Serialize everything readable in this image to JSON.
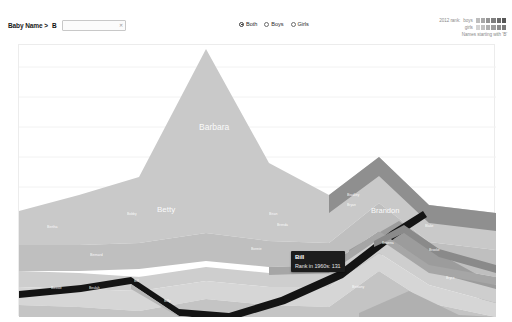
{
  "toolbar": {
    "filter_label": "Baby Name >",
    "filter_value": "B",
    "input_placeholder": "",
    "clear_icon": "clear-icon",
    "gender_options": [
      {
        "label": "Both",
        "selected": true
      },
      {
        "label": "Boys",
        "selected": false
      },
      {
        "label": "Girls",
        "selected": false
      }
    ]
  },
  "legend": {
    "rank_label": "2012 rank:",
    "boys_label": "boys",
    "girls_label": "girls",
    "note": "Names starting with 'B'",
    "boys_scale": [
      "#bdbdbd",
      "#a8a8a8",
      "#949494",
      "#7f7f7f",
      "#6b6b6b",
      "#565656"
    ],
    "girls_scale": [
      "#d4d4d4",
      "#c2c2c2",
      "#b0b0b0",
      "#9e9e9e",
      "#8c8c8c",
      "#7a7a7a"
    ]
  },
  "tooltip": {
    "name": "Bill",
    "detail": "Rank in 1960s: 131"
  },
  "chart_data": {
    "type": "area",
    "xlabel": "",
    "ylabel": "",
    "grid": true,
    "legend_position": "top-right",
    "x": [
      "1880s",
      "1890s",
      "1900s",
      "1910s",
      "1920s",
      "1930s",
      "1940s",
      "1950s",
      "1960s",
      "1970s",
      "1980s",
      "1990s",
      "2000s",
      "2010s"
    ],
    "highlighted_series": "Bill",
    "highlight_value": 131,
    "highlight_decade": "1960s",
    "series": [
      {
        "name": "Barbara",
        "values": [
          6,
          10,
          18,
          60,
          210,
          395,
          300,
          205,
          120,
          52,
          22,
          10,
          6,
          4
        ]
      },
      {
        "name": "Betty",
        "values": [
          30,
          48,
          72,
          150,
          320,
          300,
          170,
          96,
          44,
          18,
          9,
          5,
          3,
          2
        ]
      },
      {
        "name": "Bertha",
        "values": [
          70,
          66,
          54,
          40,
          24,
          13,
          7,
          4,
          2,
          1,
          1,
          1,
          1,
          1
        ]
      },
      {
        "name": "Bessie",
        "values": [
          62,
          58,
          46,
          32,
          18,
          10,
          5,
          3,
          2,
          1,
          1,
          1,
          1,
          1
        ]
      },
      {
        "name": "Beulah",
        "values": [
          22,
          24,
          21,
          17,
          11,
          6,
          3,
          2,
          1,
          1,
          1,
          1,
          1,
          1
        ]
      },
      {
        "name": "Bill",
        "values": [
          4,
          7,
          12,
          22,
          40,
          58,
          66,
          60,
          48,
          30,
          16,
          8,
          5,
          3
        ]
      },
      {
        "name": "Billy",
        "values": [
          3,
          6,
          14,
          34,
          74,
          110,
          120,
          102,
          70,
          40,
          20,
          10,
          6,
          4
        ]
      },
      {
        "name": "Bobby",
        "values": [
          2,
          3,
          6,
          18,
          52,
          96,
          112,
          94,
          62,
          34,
          17,
          9,
          5,
          3
        ]
      },
      {
        "name": "Benjamin",
        "values": [
          26,
          24,
          22,
          22,
          24,
          26,
          34,
          44,
          58,
          92,
          140,
          168,
          190,
          205
        ]
      },
      {
        "name": "Brandon",
        "values": [
          1,
          1,
          1,
          1,
          2,
          3,
          5,
          10,
          26,
          86,
          190,
          235,
          150,
          70
        ]
      },
      {
        "name": "Bradley",
        "values": [
          1,
          1,
          1,
          2,
          4,
          7,
          12,
          22,
          36,
          52,
          60,
          52,
          38,
          26
        ]
      },
      {
        "name": "Brian",
        "values": [
          1,
          1,
          2,
          3,
          6,
          14,
          38,
          96,
          160,
          175,
          140,
          95,
          55,
          32
        ]
      },
      {
        "name": "Brittany",
        "values": [
          1,
          1,
          1,
          1,
          1,
          1,
          1,
          1,
          2,
          14,
          120,
          170,
          60,
          18
        ]
      },
      {
        "name": "Brenda",
        "values": [
          1,
          2,
          3,
          6,
          16,
          44,
          88,
          96,
          70,
          40,
          20,
          11,
          7,
          5
        ]
      },
      {
        "name": "Bruce",
        "values": [
          2,
          4,
          8,
          18,
          38,
          58,
          64,
          52,
          34,
          18,
          9,
          5,
          3,
          2
        ]
      },
      {
        "name": "Blake",
        "values": [
          1,
          1,
          1,
          2,
          3,
          4,
          6,
          9,
          14,
          24,
          40,
          56,
          64,
          62
        ]
      },
      {
        "name": "Bryan",
        "values": [
          1,
          1,
          1,
          2,
          3,
          6,
          14,
          30,
          54,
          76,
          88,
          80,
          58,
          38
        ]
      },
      {
        "name": "Beverly",
        "values": [
          1,
          2,
          6,
          20,
          62,
          108,
          96,
          62,
          32,
          14,
          7,
          4,
          2,
          2
        ]
      },
      {
        "name": "Bonnie",
        "values": [
          1,
          2,
          4,
          10,
          30,
          62,
          72,
          58,
          34,
          16,
          8,
          4,
          3,
          2
        ]
      },
      {
        "name": "Bernard",
        "values": [
          14,
          18,
          22,
          28,
          34,
          32,
          26,
          18,
          11,
          6,
          4,
          3,
          2,
          2
        ]
      }
    ],
    "band_labels": [
      {
        "name": "Barbara",
        "x": 240,
        "y": 126,
        "size": 8.5
      },
      {
        "name": "Betty",
        "x": 198,
        "y": 209,
        "size": 8.0
      },
      {
        "name": "Benjamin",
        "x": 383,
        "y": 147,
        "size": 6.0
      },
      {
        "name": "Brandon",
        "x": 412,
        "y": 210,
        "size": 7.5
      },
      {
        "name": "Bertha",
        "x": 88,
        "y": 229,
        "size": 3.6
      },
      {
        "name": "Bessie",
        "x": 92,
        "y": 290,
        "size": 3.6
      },
      {
        "name": "Bernard",
        "x": 131,
        "y": 257,
        "size": 3.6
      },
      {
        "name": "Beulah",
        "x": 130,
        "y": 290,
        "size": 3.4
      },
      {
        "name": "Bill",
        "x": 175,
        "y": 283,
        "size": 3.6
      },
      {
        "name": "Billy",
        "x": 205,
        "y": 303,
        "size": 3.6
      },
      {
        "name": "Bobby",
        "x": 168,
        "y": 216,
        "size": 3.4
      },
      {
        "name": "Brian",
        "x": 310,
        "y": 216,
        "size": 3.6
      },
      {
        "name": "Bradley",
        "x": 388,
        "y": 197,
        "size": 3.6
      },
      {
        "name": "Bryan",
        "x": 388,
        "y": 207,
        "size": 3.4
      },
      {
        "name": "Brianna",
        "x": 423,
        "y": 245,
        "size": 3.4
      },
      {
        "name": "Blake",
        "x": 466,
        "y": 228,
        "size": 3.4
      },
      {
        "name": "Brittany",
        "x": 393,
        "y": 289,
        "size": 3.6
      },
      {
        "name": "Brooke",
        "x": 470,
        "y": 252,
        "size": 3.4
      },
      {
        "name": "Bryce",
        "x": 487,
        "y": 280,
        "size": 3.4
      },
      {
        "name": "Bella",
        "x": 488,
        "y": 200,
        "size": 3.4
      },
      {
        "name": "Beverly",
        "x": 354,
        "y": 267,
        "size": 3.4
      },
      {
        "name": "Bonnie",
        "x": 292,
        "y": 251,
        "size": 3.4
      },
      {
        "name": "Brenda",
        "x": 318,
        "y": 227,
        "size": 3.4
      }
    ]
  }
}
